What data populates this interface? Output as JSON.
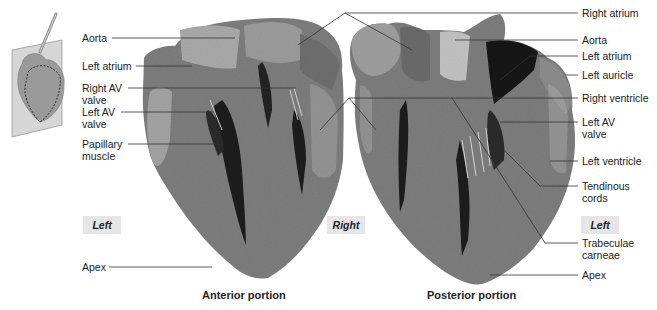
{
  "figure": {
    "inset_icon": "heart-section-plane-icon",
    "colors": {
      "myocardium": "#7a7a7a",
      "highlight": "#b5b5b5",
      "cavity": "#1c1c1c",
      "tag_bg": "#e6e6e6",
      "leader": "#333333"
    },
    "anterior": {
      "caption": "Anterior portion",
      "left_labels": [
        {
          "id": "aorta",
          "text": "Aorta"
        },
        {
          "id": "left-atrium",
          "text": "Left atrium"
        },
        {
          "id": "right-av-valve",
          "line1": "Right AV",
          "line2": "valve"
        },
        {
          "id": "left-av-valve",
          "line1": "Left AV",
          "line2": "valve"
        },
        {
          "id": "papillary-muscle",
          "line1": "Papillary",
          "line2": "muscle"
        },
        {
          "id": "apex",
          "text": "Apex"
        }
      ],
      "side_left": "Left",
      "side_right": "Right"
    },
    "posterior": {
      "caption": "Posterior portion",
      "right_labels": [
        {
          "id": "right-atrium",
          "text": "Right atrium"
        },
        {
          "id": "aorta",
          "text": "Aorta"
        },
        {
          "id": "left-atrium",
          "text": "Left atrium"
        },
        {
          "id": "left-auricle",
          "text": "Left auricle"
        },
        {
          "id": "right-ventricle",
          "text": "Right ventricle"
        },
        {
          "id": "left-av-valve",
          "line1": "Left AV",
          "line2": "valve"
        },
        {
          "id": "left-ventricle",
          "text": "Left ventricle"
        },
        {
          "id": "tendinous-cords",
          "line1": "Tendinous",
          "line2": "cords"
        },
        {
          "id": "trabeculae-carneae",
          "line1": "Trabeculae",
          "line2": "carneae"
        },
        {
          "id": "apex",
          "text": "Apex"
        }
      ],
      "side_left": "Right",
      "side_right": "Left"
    }
  }
}
